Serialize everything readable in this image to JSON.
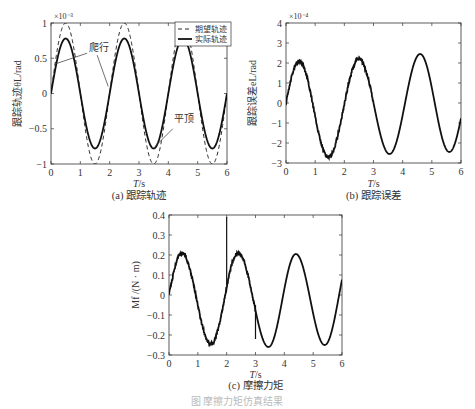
{
  "figure_caption": "图 摩擦力矩仿真结果",
  "chart_data": [
    {
      "id": "a",
      "type": "line",
      "caption": "(a) 跟踪轨迹",
      "xlabel": "T/s",
      "ylabel": "跟踪轨迹θL/rad",
      "y_multiplier": "×10⁻³",
      "xlim": [
        0,
        6
      ],
      "ylim": [
        -1,
        1
      ],
      "xticks": [
        "0",
        "1",
        "2",
        "3",
        "4",
        "5",
        "6"
      ],
      "yticks": [
        "1",
        "0.5",
        "0",
        "-0.5",
        "-1"
      ],
      "grid": false,
      "legend_position": "top-right",
      "series": [
        {
          "name": "期望轨迹",
          "style": "dashed",
          "amplitude": 1.0,
          "period": 2,
          "phase": 0
        },
        {
          "name": "实际轨迹",
          "style": "solid",
          "amplitude": 0.78,
          "period": 2,
          "phase": 0
        }
      ],
      "annotations": [
        {
          "text": "爬行",
          "x": 1.3,
          "y": 0.6
        },
        {
          "text": "平顶",
          "x": 4.2,
          "y": -0.4
        }
      ]
    },
    {
      "id": "b",
      "type": "line",
      "caption": "(b) 跟踪误差",
      "xlabel": "T/s",
      "ylabel": "跟踪误差eL/rad",
      "y_multiplier": "×10⁻⁴",
      "xlim": [
        0,
        6
      ],
      "ylim": [
        -3,
        4
      ],
      "xticks": [
        "0",
        "1",
        "2",
        "3",
        "4",
        "5",
        "6"
      ],
      "yticks": [
        "4",
        "3",
        "2",
        "1",
        "0",
        "-1",
        "-2",
        "-3"
      ],
      "grid": false,
      "series": [
        {
          "name": "跟踪误差",
          "style": "solid",
          "peaks": [
            {
              "t": 0.45,
              "v": 2.1
            },
            {
              "t": 1.45,
              "v": -2.7
            },
            {
              "t": 2.5,
              "v": 2.2
            },
            {
              "t": 3.55,
              "v": -2.55
            },
            {
              "t": 4.6,
              "v": 2.45
            },
            {
              "t": 5.6,
              "v": -2.45
            }
          ]
        }
      ]
    },
    {
      "id": "c",
      "type": "line",
      "caption": "(c) 摩擦力矩",
      "xlabel": "T/s",
      "ylabel": "Mf /(N · m)",
      "xlim": [
        0,
        6
      ],
      "ylim": [
        -0.3,
        0.4
      ],
      "xticks": [
        "0",
        "1",
        "2",
        "3",
        "4",
        "5",
        "6"
      ],
      "yticks": [
        "0.4",
        "0.3",
        "0.2",
        "0.1",
        "0",
        "-0.1",
        "-0.2",
        "-0.3"
      ],
      "grid": false,
      "series": [
        {
          "name": "摩擦力矩",
          "style": "solid",
          "peaks": [
            {
              "t": 0.45,
              "v": 0.21
            },
            {
              "t": 1.45,
              "v": -0.245
            },
            {
              "t": 2.4,
              "v": 0.21
            },
            {
              "t": 3.45,
              "v": -0.26
            },
            {
              "t": 4.4,
              "v": 0.205
            },
            {
              "t": 5.4,
              "v": -0.25
            }
          ],
          "spikes": [
            {
              "t": 2.0,
              "v": 0.39
            },
            {
              "t": 3.0,
              "v": -0.22
            }
          ]
        }
      ]
    }
  ]
}
